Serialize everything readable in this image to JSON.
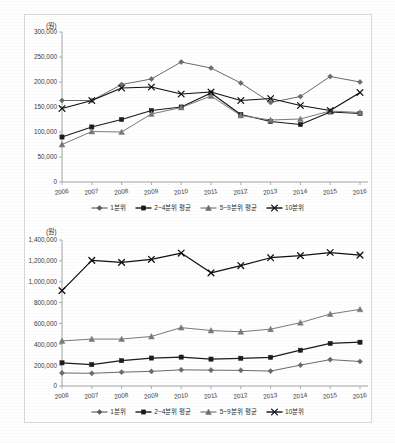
{
  "document": {
    "type": "two-panel-line-chart-figure",
    "background_color": "#ffffff",
    "frame_color": "#d9d9d9"
  },
  "series_names": {
    "s1": "1분위",
    "s2": "2~4분위 평균",
    "s3": "5~9분위 평균",
    "s4": "10분위"
  },
  "legend": {
    "position": "bottom-center",
    "items": [
      {
        "label": "1분위",
        "marker": "diamond-marker-icon",
        "color": "#595959"
      },
      {
        "label": "2~4분위 평균",
        "marker": "square-marker-icon",
        "color": "#1a1a1a"
      },
      {
        "label": "5~9분위 평균",
        "marker": "triangle-marker-icon",
        "color": "#6e6e6e"
      },
      {
        "label": "10분위",
        "marker": "cross-marker-icon",
        "color": "#111111"
      }
    ]
  },
  "chart_data": [
    {
      "id": "chart-top",
      "type": "line",
      "title": "",
      "unit_label": "(원)",
      "xlabel": "",
      "ylabel": "",
      "grid": false,
      "legend_position": "bottom",
      "categories": [
        "2006",
        "2007",
        "2008",
        "2009",
        "2010",
        "2011",
        "2012",
        "2013",
        "2014",
        "2015",
        "2016"
      ],
      "ylim": [
        0,
        300000
      ],
      "ytick_step": 50000,
      "ytick_labels": [
        "0",
        "50,000",
        "100,000",
        "150,000",
        "200,000",
        "250,000",
        "300,000"
      ],
      "series": [
        {
          "name": "1분위",
          "marker": "diamond",
          "color": "#6b6b6b",
          "values": [
            163000,
            163000,
            195000,
            206000,
            240000,
            228000,
            198000,
            159000,
            171000,
            211000,
            200000
          ]
        },
        {
          "name": "2~4분위 평균",
          "marker": "square",
          "color": "#1c1c1c",
          "values": [
            90000,
            110000,
            125000,
            143000,
            150000,
            178000,
            135000,
            121000,
            115000,
            140000,
            137000
          ]
        },
        {
          "name": "5~9분위 평균",
          "marker": "triangle",
          "color": "#7a7a7a",
          "values": [
            75000,
            101000,
            100000,
            136000,
            149000,
            172000,
            133000,
            124000,
            126000,
            142000,
            139000
          ]
        },
        {
          "name": "10분위",
          "marker": "cross",
          "color": "#111111",
          "values": [
            147000,
            163000,
            188000,
            190000,
            176000,
            180000,
            163000,
            167000,
            153000,
            143000,
            179000
          ]
        }
      ]
    },
    {
      "id": "chart-bottom",
      "type": "line",
      "title": "",
      "unit_label": "(원)",
      "xlabel": "",
      "ylabel": "",
      "grid": false,
      "legend_position": "bottom",
      "categories": [
        "2006",
        "2007",
        "2008",
        "2009",
        "2010",
        "2011",
        "2012",
        "2013",
        "2014",
        "2015",
        "2016"
      ],
      "ylim": [
        0,
        1400000
      ],
      "ytick_step": 200000,
      "ytick_labels": [
        "0",
        "200,000",
        "400,000",
        "600,000",
        "800,000",
        "1,000,000",
        "1,200,000",
        "1,400,000"
      ],
      "series": [
        {
          "name": "1분위",
          "marker": "diamond",
          "color": "#6b6b6b",
          "values": [
            125000,
            122000,
            133000,
            140000,
            155000,
            152000,
            150000,
            143000,
            200000,
            253000,
            235000
          ]
        },
        {
          "name": "2~4분위 평균",
          "marker": "square",
          "color": "#1c1c1c",
          "values": [
            222000,
            205000,
            243000,
            268000,
            277000,
            258000,
            266000,
            275000,
            343000,
            408000,
            420000
          ]
        },
        {
          "name": "5~9분위 평균",
          "marker": "triangle",
          "color": "#7a7a7a",
          "values": [
            432000,
            450000,
            450000,
            475000,
            560000,
            532000,
            520000,
            545000,
            607000,
            690000,
            735000
          ]
        },
        {
          "name": "10분위",
          "marker": "cross",
          "color": "#111111",
          "values": [
            915000,
            1205000,
            1185000,
            1215000,
            1275000,
            1085000,
            1155000,
            1230000,
            1250000,
            1280000,
            1255000
          ]
        }
      ]
    }
  ]
}
